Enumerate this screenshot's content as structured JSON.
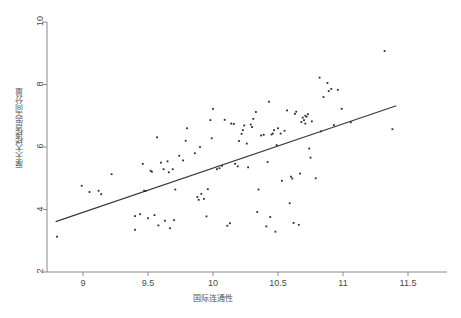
{
  "chart_data": {
    "type": "scatter",
    "title": "",
    "xlabel": "国际连通性",
    "ylabel": "摩天大楼楼层空间分量",
    "xlim": [
      8.75,
      11.55
    ],
    "ylim": [
      2.0,
      10.2
    ],
    "xticks": [
      "9",
      "9.5",
      "10",
      "10.5",
      "11",
      "11.5"
    ],
    "xtick_values": [
      9,
      9.5,
      10,
      10.5,
      11,
      11.5
    ],
    "yticks": [
      "2",
      "4",
      "6",
      "8",
      "10"
    ],
    "ytick_values": [
      2,
      4,
      6,
      8,
      10
    ],
    "grid": false,
    "legend": "none",
    "marker_color": "#2b2b2b",
    "line_color": "#3a3a3a",
    "axis_color": "#888888",
    "background": "#ffffff",
    "fit_line": {
      "label": "linear fit",
      "x": [
        8.79,
        11.41
      ],
      "y": [
        3.61,
        7.32
      ]
    },
    "points": [
      [
        8.8,
        3.13
      ],
      [
        8.99,
        4.76
      ],
      [
        9.05,
        4.56
      ],
      [
        9.12,
        4.6
      ],
      [
        9.14,
        4.49
      ],
      [
        9.22,
        5.13
      ],
      [
        9.4,
        3.79
      ],
      [
        9.4,
        3.35
      ],
      [
        9.44,
        3.85
      ],
      [
        9.46,
        5.46
      ],
      [
        9.47,
        4.6
      ],
      [
        9.48,
        4.59
      ],
      [
        9.5,
        3.72
      ],
      [
        9.52,
        5.24
      ],
      [
        9.53,
        5.21
      ],
      [
        9.55,
        3.82
      ],
      [
        9.57,
        6.31
      ],
      [
        9.58,
        3.49
      ],
      [
        9.6,
        5.5
      ],
      [
        9.62,
        5.29
      ],
      [
        9.63,
        3.64
      ],
      [
        9.65,
        5.54
      ],
      [
        9.66,
        5.19
      ],
      [
        9.67,
        3.4
      ],
      [
        9.69,
        5.29
      ],
      [
        9.7,
        3.66
      ],
      [
        9.71,
        4.64
      ],
      [
        9.74,
        5.72
      ],
      [
        9.77,
        5.57
      ],
      [
        9.79,
        6.2
      ],
      [
        9.8,
        6.6
      ],
      [
        9.86,
        5.8
      ],
      [
        9.88,
        4.4
      ],
      [
        9.89,
        4.31
      ],
      [
        9.9,
        6.0
      ],
      [
        9.91,
        4.5
      ],
      [
        9.93,
        4.34
      ],
      [
        9.95,
        3.78
      ],
      [
        9.96,
        4.65
      ],
      [
        9.98,
        6.86
      ],
      [
        9.99,
        6.28
      ],
      [
        10.0,
        7.22
      ],
      [
        10.03,
        5.29
      ],
      [
        10.05,
        5.32
      ],
      [
        10.07,
        5.4
      ],
      [
        10.09,
        6.87
      ],
      [
        10.11,
        3.48
      ],
      [
        10.13,
        3.56
      ],
      [
        10.14,
        6.75
      ],
      [
        10.16,
        6.74
      ],
      [
        10.17,
        5.46
      ],
      [
        10.19,
        5.38
      ],
      [
        10.2,
        6.19
      ],
      [
        10.22,
        6.42
      ],
      [
        10.23,
        6.54
      ],
      [
        10.24,
        6.69
      ],
      [
        10.26,
        6.11
      ],
      [
        10.27,
        5.35
      ],
      [
        10.29,
        6.72
      ],
      [
        10.3,
        6.64
      ],
      [
        10.31,
        6.9
      ],
      [
        10.33,
        7.12
      ],
      [
        10.34,
        3.92
      ],
      [
        10.35,
        4.64
      ],
      [
        10.37,
        6.37
      ],
      [
        10.39,
        6.39
      ],
      [
        10.41,
        3.46
      ],
      [
        10.42,
        5.52
      ],
      [
        10.43,
        7.45
      ],
      [
        10.44,
        3.76
      ],
      [
        10.45,
        6.4
      ],
      [
        10.46,
        6.43
      ],
      [
        10.47,
        6.54
      ],
      [
        10.48,
        3.29
      ],
      [
        10.49,
        6.06
      ],
      [
        10.5,
        6.6
      ],
      [
        10.52,
        6.43
      ],
      [
        10.53,
        4.92
      ],
      [
        10.55,
        6.52
      ],
      [
        10.57,
        7.17
      ],
      [
        10.59,
        4.2
      ],
      [
        10.6,
        5.05
      ],
      [
        10.61,
        4.99
      ],
      [
        10.62,
        3.57
      ],
      [
        10.63,
        7.06
      ],
      [
        10.64,
        7.13
      ],
      [
        10.66,
        3.51
      ],
      [
        10.67,
        5.15
      ],
      [
        10.68,
        6.8
      ],
      [
        10.69,
        6.94
      ],
      [
        10.7,
        6.86
      ],
      [
        10.71,
        7.0
      ],
      [
        10.71,
        6.75
      ],
      [
        10.72,
        6.97
      ],
      [
        10.73,
        7.05
      ],
      [
        10.74,
        5.95
      ],
      [
        10.75,
        5.66
      ],
      [
        10.76,
        6.82
      ],
      [
        10.79,
        5.0
      ],
      [
        10.82,
        8.22
      ],
      [
        10.83,
        6.5
      ],
      [
        10.85,
        7.6
      ],
      [
        10.88,
        8.05
      ],
      [
        10.89,
        7.79
      ],
      [
        10.91,
        7.86
      ],
      [
        10.93,
        6.7
      ],
      [
        10.96,
        7.83
      ],
      [
        10.99,
        7.22
      ],
      [
        11.06,
        6.79
      ],
      [
        11.32,
        9.07
      ],
      [
        11.38,
        6.57
      ]
    ]
  },
  "axes": {
    "x_title": "国际连通性",
    "y_title": "摩天大楼楼层空间分量",
    "x_tick_labels": [
      "9",
      "9.5",
      "10",
      "10.5",
      "11",
      "11.5"
    ],
    "y_tick_labels": [
      "2",
      "4",
      "6",
      "8",
      "10"
    ]
  }
}
